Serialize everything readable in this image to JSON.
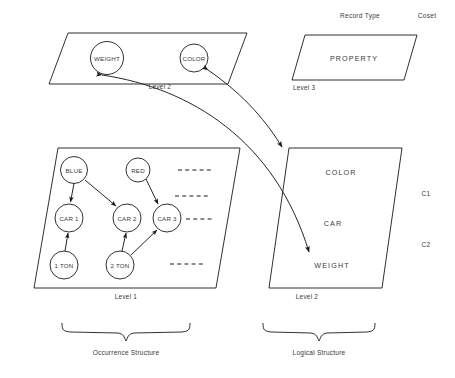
{
  "diagram": {
    "title_visible": false,
    "headers": {
      "record_type": "Record Type",
      "coset": "Coset"
    },
    "occurrence_structure": {
      "caption": "Occurrence Structure",
      "level2": {
        "label": "Level 2",
        "nodes": [
          {
            "id": "weight",
            "label": "WEIGHT"
          },
          {
            "id": "color",
            "label": "COLOR"
          }
        ]
      },
      "level1": {
        "label": "Level 1",
        "nodes": [
          {
            "id": "blue",
            "label": "BLUE"
          },
          {
            "id": "red",
            "label": "RED"
          },
          {
            "id": "car1",
            "label": "CAR 1"
          },
          {
            "id": "car2",
            "label": "CAR 2"
          },
          {
            "id": "car3",
            "label": "CAR 3"
          },
          {
            "id": "ton1",
            "label": "1 TON"
          },
          {
            "id": "ton2",
            "label": "2 TON"
          }
        ],
        "edges": [
          {
            "from": "blue",
            "to": "car1"
          },
          {
            "from": "blue",
            "to": "car2"
          },
          {
            "from": "red",
            "to": "car3"
          },
          {
            "from": "ton1",
            "to": "car1"
          },
          {
            "from": "ton2",
            "to": "car2"
          },
          {
            "from": "ton2",
            "to": "car3"
          }
        ],
        "ellipsis_rows": 4
      }
    },
    "logical_structure": {
      "caption": "Logical Structure",
      "level3": {
        "label": "Level 3",
        "entries": [
          "PROPERTY"
        ]
      },
      "level2": {
        "label": "Level 2",
        "entries": [
          "COLOR",
          "CAR",
          "WEIGHT"
        ],
        "coset_marks": [
          "C1",
          "C2"
        ]
      }
    },
    "mappings": [
      {
        "from": "occurrence.level2.color",
        "to": "logical.level2",
        "style": "double-headed-curve"
      },
      {
        "from": "occurrence.level2.weight",
        "to": "logical.level2.weight",
        "style": "double-headed-curve"
      }
    ],
    "colors": {
      "stroke": "#1a1a1a",
      "text": "#3a3a3a",
      "background": "#ffffff"
    }
  }
}
